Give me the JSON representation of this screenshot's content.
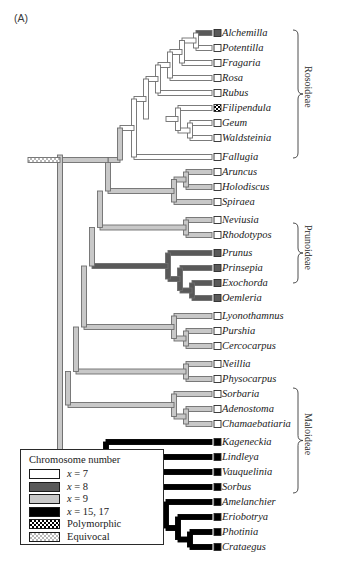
{
  "panel": {
    "label": "(A)"
  },
  "colors": {
    "x7": "#ffffff",
    "x8": "#595959",
    "x9": "#c8c8c8",
    "x15_17": "#000000",
    "outline": "#6e6e6e",
    "outline_dark": "#2a2a2a",
    "text": "#1a1a1a"
  },
  "legend": {
    "title": "Chromosome number",
    "items": [
      {
        "name": "legend-swatch-x7",
        "label": "x = 7",
        "italic_prefix": "x",
        "rest": " = 7",
        "fill": "#ffffff",
        "pattern": "solid"
      },
      {
        "name": "legend-swatch-x8",
        "label": "x = 8",
        "italic_prefix": "x",
        "rest": " = 8",
        "fill": "#595959",
        "pattern": "solid"
      },
      {
        "name": "legend-swatch-x9",
        "label": "x = 9",
        "italic_prefix": "x",
        "rest": " = 9",
        "fill": "#c8c8c8",
        "pattern": "solid"
      },
      {
        "name": "legend-swatch-x15-17",
        "label": "x = 15, 17",
        "italic_prefix": "x",
        "rest": " = 15, 17",
        "fill": "#000000",
        "pattern": "solid"
      },
      {
        "name": "legend-swatch-polymorphic",
        "label": "Polymorphic",
        "italic_prefix": "",
        "rest": "Polymorphic",
        "fill": "#000000",
        "pattern": "checker"
      },
      {
        "name": "legend-swatch-equivocal",
        "label": "Equivocal",
        "italic_prefix": "",
        "rest": "Equivocal",
        "fill": "#c8c8c8",
        "pattern": "equivocal"
      }
    ]
  },
  "clade_brackets": [
    {
      "name": "bracket-rosoideae",
      "label": "Rosoideae",
      "top": 30,
      "bottom": 158
    },
    {
      "name": "bracket-prunoideae",
      "label": "Prunoideae",
      "top": 223,
      "bottom": 283
    },
    {
      "name": "bracket-maloideae",
      "label": "Maloideae",
      "top": 388,
      "bottom": 493
    }
  ],
  "taxa": [
    {
      "name": "Alchemilla",
      "y": 33,
      "state": "x8",
      "tip": "x8"
    },
    {
      "name": "Potentilla",
      "y": 48,
      "state": "x7",
      "tip": "x7"
    },
    {
      "name": "Fragaria",
      "y": 63,
      "state": "x7",
      "tip": "x7"
    },
    {
      "name": "Rosa",
      "y": 78,
      "state": "x7",
      "tip": "x7"
    },
    {
      "name": "Rubus",
      "y": 93,
      "state": "x7",
      "tip": "x7"
    },
    {
      "name": "Filipendula",
      "y": 108,
      "state": "x7",
      "tip": "polymorphic"
    },
    {
      "name": "Geum",
      "y": 123,
      "state": "x7",
      "tip": "x7"
    },
    {
      "name": "Waldsteinia",
      "y": 138,
      "state": "x7",
      "tip": "x7"
    },
    {
      "name": "Fallugia",
      "y": 157,
      "state": "x7",
      "tip": "x7"
    },
    {
      "name": "Aruncus",
      "y": 172,
      "state": "x9",
      "tip": "x7"
    },
    {
      "name": "Holodiscus",
      "y": 187,
      "state": "x9",
      "tip": "x7"
    },
    {
      "name": "Spiraea",
      "y": 202,
      "state": "x9",
      "tip": "x7"
    },
    {
      "name": "Neviusia",
      "y": 220,
      "state": "x9",
      "tip": "x7"
    },
    {
      "name": "Rhodotypos",
      "y": 235,
      "state": "x9",
      "tip": "x7"
    },
    {
      "name": "Prunus",
      "y": 253,
      "state": "x8",
      "tip": "x8"
    },
    {
      "name": "Prinsepia",
      "y": 268,
      "state": "x8",
      "tip": "x8"
    },
    {
      "name": "Exochorda",
      "y": 283,
      "state": "x8",
      "tip": "x8"
    },
    {
      "name": "Oemleria",
      "y": 298,
      "state": "x8",
      "tip": "x8"
    },
    {
      "name": "Lyonothamnus",
      "y": 316,
      "state": "x9",
      "tip": "x7"
    },
    {
      "name": "Purshia",
      "y": 331,
      "state": "x9",
      "tip": "x7"
    },
    {
      "name": "Cercocarpus",
      "y": 346,
      "state": "x9",
      "tip": "x7"
    },
    {
      "name": "Neillia",
      "y": 364,
      "state": "x9",
      "tip": "x7"
    },
    {
      "name": "Physocarpus",
      "y": 379,
      "state": "x9",
      "tip": "x7"
    },
    {
      "name": "Sorbaria",
      "y": 394,
      "state": "x9",
      "tip": "x7"
    },
    {
      "name": "Adenostoma",
      "y": 409,
      "state": "x9",
      "tip": "x7"
    },
    {
      "name": "Chamaebatiaria",
      "y": 424,
      "state": "x9",
      "tip": "x7"
    },
    {
      "name": "Kageneckia",
      "y": 442,
      "state": "x15_17",
      "tip": "x15_17"
    },
    {
      "name": "Lindleya",
      "y": 457,
      "state": "x15_17",
      "tip": "x15_17"
    },
    {
      "name": "Vauquelinia",
      "y": 472,
      "state": "x15_17",
      "tip": "x15_17"
    },
    {
      "name": "Sorbus",
      "y": 487,
      "state": "x15_17",
      "tip": "x15_17"
    },
    {
      "name": "Amelanchier",
      "y": 502,
      "state": "x15_17",
      "tip": "x15_17"
    },
    {
      "name": "Eriobotrya",
      "y": 517,
      "state": "x15_17",
      "tip": "x15_17"
    },
    {
      "name": "Photinia",
      "y": 532,
      "state": "x15_17",
      "tip": "x15_17"
    },
    {
      "name": "Crataegus",
      "y": 547,
      "state": "x15_17",
      "tip": "x15_17"
    }
  ],
  "tree_geometry": {
    "tip_x": 212,
    "label_x": 222,
    "root_x": 28,
    "tip_box_size": 7
  }
}
